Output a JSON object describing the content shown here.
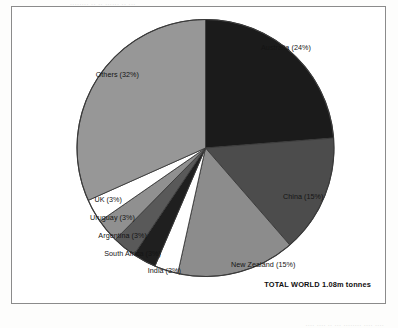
{
  "page": {
    "top_bleed_text": "........ ..  .. ......  ..  ...",
    "bottom_bleed_text": ".... ....  .. ...  ........  ....  ...."
  },
  "figure": {
    "total_caption": "TOTAL WORLD 1.08m tonnes"
  },
  "chart_data": {
    "type": "pie",
    "title": "",
    "subtitle": "",
    "xlabel": "",
    "ylabel": "",
    "legend_position": "callout-labels",
    "grid": false,
    "total_label": "TOTAL WORLD 1.08m tonnes",
    "total_value": 1.08,
    "total_units": "m tonnes",
    "start_angle_deg": 0,
    "direction": "clockwise",
    "categories": [
      "Australia",
      "China",
      "New Zealand",
      "India",
      "South Africa",
      "Argentina",
      "Uruguay",
      "UK",
      "Others"
    ],
    "values": [
      24,
      15,
      15,
      3,
      3,
      3,
      3,
      3,
      32
    ],
    "slices": [
      {
        "label": "Australia (24%)",
        "name": "Australia",
        "value": 24,
        "color": "#1b1b1b"
      },
      {
        "label": "China (15%)",
        "name": "China",
        "value": 15,
        "color": "#4c4c4c"
      },
      {
        "label": "New Zealand (15%)",
        "name": "New Zealand",
        "value": 15,
        "color": "#8c8c8c"
      },
      {
        "label": "India (3%)",
        "name": "India",
        "value": 3,
        "color": "#ffffff"
      },
      {
        "label": "South Africa (3%)",
        "name": "South Africa",
        "value": 3,
        "color": "#1f1f1f"
      },
      {
        "label": "Argentina (3%)",
        "name": "Argentina",
        "value": 3,
        "color": "#595959"
      },
      {
        "label": "Uruguay (3%)",
        "name": "Uruguay",
        "value": 3,
        "color": "#909090"
      },
      {
        "label": "UK (3%)",
        "name": "UK",
        "value": 3,
        "color": "#ffffff"
      },
      {
        "label": "Others (32%)",
        "name": "Others",
        "value": 32,
        "color": "#979797"
      }
    ],
    "colors": {
      "outline": "#3a3a3a",
      "frame": "#8b8b8b",
      "text": "#141414",
      "background": "#ffffff"
    }
  }
}
